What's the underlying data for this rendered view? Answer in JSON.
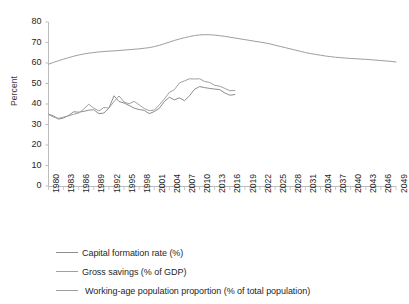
{
  "title_remnant": "",
  "chart_data": {
    "type": "line",
    "title": "",
    "xlabel": "",
    "ylabel": "Percent",
    "ylim": [
      0,
      80
    ],
    "ytick_step": 10,
    "yticks": [
      0,
      10,
      20,
      30,
      40,
      50,
      60,
      70,
      80
    ],
    "xlim": [
      1980,
      2049
    ],
    "xtick_step": 3,
    "xticks": [
      1980,
      1983,
      1986,
      1989,
      1992,
      1995,
      1998,
      2001,
      2004,
      2007,
      2010,
      2013,
      2016,
      2019,
      2022,
      2025,
      2028,
      2031,
      2034,
      2037,
      2040,
      2043,
      2046,
      2049
    ],
    "grid": false,
    "legend_position": "below",
    "colors": {
      "capital_formation": "#8c8c8c",
      "gross_savings": "#a0a0a0",
      "working_age": "#9e9e9e",
      "axis": "#bdbdbd",
      "text": "#1f1f1f"
    },
    "series": [
      {
        "name": "Capital formation rate (%)",
        "x_start": 1980,
        "values": [
          35.0,
          34.2,
          32.6,
          33.2,
          34.4,
          36.2,
          36.0,
          36.4,
          37.0,
          37.2,
          35.3,
          35.6,
          38.0,
          44.0,
          41.2,
          40.5,
          39.3,
          38.0,
          37.3,
          36.9,
          35.3,
          36.3,
          37.9,
          41.2,
          43.3,
          42.0,
          43.0,
          41.6,
          44.0,
          47.2,
          48.5,
          48.0,
          47.6,
          47.3,
          47.0,
          45.4,
          44.3,
          44.6
        ]
      },
      {
        "name": "Gross savings (% of GDP)",
        "x_start": 1980,
        "values": [
          34.9,
          33.6,
          33.0,
          33.6,
          34.2,
          35.0,
          35.6,
          37.5,
          39.9,
          38.0,
          36.6,
          38.3,
          38.0,
          41.2,
          43.9,
          41.0,
          40.1,
          41.3,
          39.6,
          37.8,
          36.8,
          37.0,
          39.6,
          42.4,
          45.7,
          47.0,
          50.3,
          51.3,
          52.3,
          52.2,
          52.3,
          51.0,
          50.5,
          49.1,
          48.7,
          47.6,
          46.5,
          46.6
        ]
      },
      {
        "name": "Working-age population proportion (% of total population)",
        "x_start": 1980,
        "values": [
          59.4,
          60.3,
          61.1,
          61.9,
          62.6,
          63.3,
          63.9,
          64.4,
          64.8,
          65.1,
          65.4,
          65.6,
          65.8,
          65.9,
          66.1,
          66.3,
          66.5,
          66.7,
          66.9,
          67.2,
          67.5,
          68.0,
          68.6,
          69.4,
          70.2,
          71.0,
          71.7,
          72.3,
          72.9,
          73.4,
          73.7,
          73.8,
          73.8,
          73.6,
          73.3,
          73.0,
          72.6,
          72.2,
          71.8,
          71.4,
          71.0,
          70.6,
          70.2,
          69.8,
          69.3,
          68.7,
          68.1,
          67.5,
          66.9,
          66.3,
          65.7,
          65.1,
          64.6,
          64.2,
          63.8,
          63.4,
          63.1,
          62.8,
          62.6,
          62.4,
          62.2,
          62.1,
          61.9,
          61.8,
          61.6,
          61.4,
          61.2,
          61.0,
          60.8,
          60.5
        ]
      }
    ]
  },
  "legend": {
    "items": [
      {
        "label": "Capital formation rate (%)",
        "color": "#8c8c8c"
      },
      {
        "label": "Gross savings (% of GDP)",
        "color": "#a0a0a0"
      },
      {
        "label": "Working-age population proportion (% of total population)",
        "color": "#9e9e9e"
      }
    ]
  }
}
